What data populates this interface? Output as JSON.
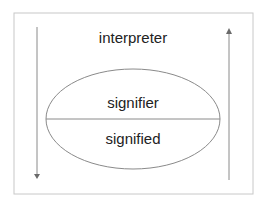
{
  "diagram": {
    "top_label": "interpreter",
    "upper_label": "signifier",
    "lower_label": "signified",
    "colors": {
      "frame": "#c8c8c8",
      "ellipse": "#8a8a8a",
      "arrow": "#8a8a8a",
      "text": "#222222"
    }
  }
}
